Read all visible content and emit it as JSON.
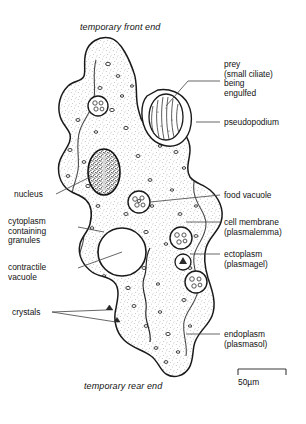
{
  "figure": {
    "title_top": "temporary front end",
    "title_bottom": "temporary rear end",
    "background_color": "#ffffff",
    "ink_color": "#1a1a1a"
  },
  "labels_right": [
    {
      "key": "prey",
      "text": "prey\n(small ciliate)\nbeing\nengulfed"
    },
    {
      "key": "pseudopodium",
      "text": "pseudopodium"
    },
    {
      "key": "food_vacuole",
      "text": "food vacuole"
    },
    {
      "key": "cell_membrane",
      "text": "cell membrane\n(plasmalemma)"
    },
    {
      "key": "ectoplasm",
      "text": "ectoplasm\n(plasmagel)"
    },
    {
      "key": "endoplasm",
      "text": "endoplasm\n(plasmasol)"
    }
  ],
  "labels_left": [
    {
      "key": "nucleus",
      "text": "nucleus"
    },
    {
      "key": "cytoplasm",
      "text": "cytoplasm\ncontaining\ngranules"
    },
    {
      "key": "contractile_vacuole",
      "text": "contractile\nvacuole"
    },
    {
      "key": "crystals",
      "text": "crystals"
    }
  ],
  "scale_bar": {
    "label": "50µm",
    "length_px": 48
  }
}
